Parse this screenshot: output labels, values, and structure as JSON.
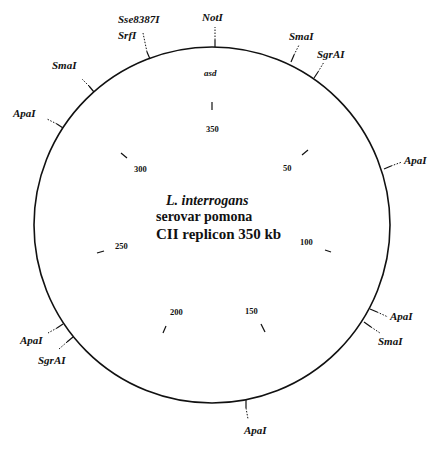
{
  "title": {
    "organism": "L.  interrogans",
    "serovar": "serovar pomona",
    "replicon": "CII replicon 350 kb"
  },
  "gene_marker": "asd",
  "map": {
    "size_kb": 350,
    "center": [
      212,
      225
    ],
    "radius": 178,
    "stroke_color": "#111111"
  },
  "scale_ticks": [
    {
      "label": "350",
      "kb": 0
    },
    {
      "label": "50",
      "kb": 50
    },
    {
      "label": "100",
      "kb": 100
    },
    {
      "label": "150",
      "kb": 150
    },
    {
      "label": "200",
      "kb": 200
    },
    {
      "label": "250",
      "kb": 250
    },
    {
      "label": "300",
      "kb": 300
    }
  ],
  "restriction_sites": [
    {
      "name": "NotI",
      "angle": 1
    },
    {
      "name": "SmaI",
      "angle": 26
    },
    {
      "name": "SgrAI",
      "angle": 35
    },
    {
      "name": "ApaI",
      "angle": 72
    },
    {
      "name": "ApaI",
      "angle": 118
    },
    {
      "name": "SmaI",
      "angle": 122
    },
    {
      "name": "ApaI",
      "angle": 169
    },
    {
      "name": "SgrAI",
      "angle": 231
    },
    {
      "name": "ApaI",
      "angle": 236
    },
    {
      "name": "ApaI",
      "angle": 303
    },
    {
      "name": "SmaI",
      "angle": 318
    },
    {
      "name": "SrfI",
      "angle": 339
    },
    {
      "name": "Sse8387I",
      "angle": 339
    }
  ]
}
